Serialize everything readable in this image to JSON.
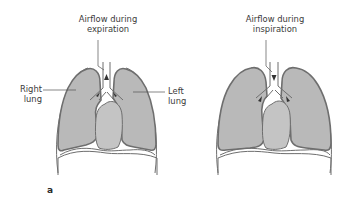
{
  "figure": {
    "panel_label": "a",
    "colors": {
      "lung_fill": "#b9b9b9",
      "lung_outline": "#6e6e6e",
      "heart_fill": "#c4c4c4",
      "background": "#ffffff",
      "line": "#555555"
    },
    "left_diagram": {
      "title_line1": "Airflow during",
      "title_line2": "expiration",
      "right_lung_line1": "Right",
      "right_lung_line2": "lung",
      "left_lung_line1": "Left",
      "left_lung_line2": "lung",
      "arrow_direction": "up"
    },
    "right_diagram": {
      "title_line1": "Airflow during",
      "title_line2": "inspiration",
      "arrow_direction": "down"
    }
  }
}
